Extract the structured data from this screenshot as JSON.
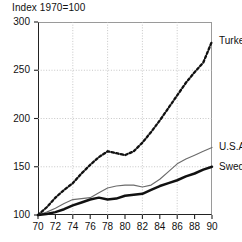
{
  "chart_data": {
    "type": "line",
    "title": "Index 1970=100",
    "panel_label": "A",
    "xlabel": "",
    "ylabel": "",
    "xlim": [
      70,
      90
    ],
    "ylim": [
      100,
      300
    ],
    "grid": true,
    "legend_position": "inline-right",
    "y_ticks": [
      100,
      150,
      200,
      250,
      300
    ],
    "y_gridlines": [
      150,
      200,
      250
    ],
    "x_ticks": [
      70,
      72,
      74,
      76,
      78,
      80,
      82,
      84,
      86,
      88,
      90
    ],
    "x_gridlines": [
      74,
      78,
      82,
      86
    ],
    "x": [
      70,
      71,
      72,
      73,
      74,
      75,
      76,
      77,
      78,
      79,
      80,
      81,
      82,
      83,
      84,
      85,
      86,
      87,
      88,
      89,
      90
    ],
    "series": [
      {
        "name": "Turkey",
        "style": "dotted",
        "values": [
          100,
          108,
          118,
          126,
          133,
          143,
          152,
          160,
          166,
          164,
          162,
          166,
          175,
          186,
          198,
          211,
          224,
          237,
          248,
          258,
          280
        ]
      },
      {
        "name": "U.S.A.",
        "style": "thin-solid",
        "values": [
          100,
          103,
          107,
          112,
          116,
          117,
          118,
          123,
          128,
          130,
          131,
          131,
          129,
          131,
          137,
          145,
          153,
          158,
          162,
          166,
          170
        ]
      },
      {
        "name": "Sweden",
        "style": "thick-solid",
        "values": [
          100,
          101,
          103,
          106,
          110,
          113,
          116,
          118,
          116,
          117,
          120,
          121,
          122,
          126,
          130,
          133,
          136,
          140,
          143,
          147,
          150
        ]
      }
    ]
  }
}
